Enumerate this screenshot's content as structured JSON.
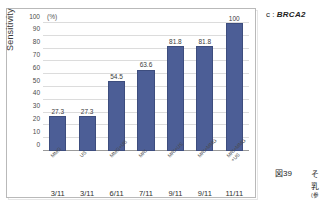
{
  "panel": {
    "tag_prefix": "c :",
    "tag_gene": "BRCA2"
  },
  "chart_data": {
    "type": "bar",
    "title": "",
    "xlabel": "",
    "ylabel": "Sensitivity",
    "yunit": "(%)",
    "ylim": [
      0,
      100
    ],
    "ytick_labels": [
      "100",
      "90",
      "80",
      "70",
      "60",
      "50",
      "40",
      "30",
      "20",
      "10",
      "0"
    ],
    "ytick_values": [
      100,
      90,
      80,
      70,
      60,
      50,
      40,
      30,
      20,
      10,
      0
    ],
    "grid": true,
    "legend": "none",
    "bar_color": "#4c5e96",
    "categories": [
      "MMG",
      "US",
      "MMG+US",
      "MRI",
      "MRI+US",
      "MRI+MMG",
      "MRI+MMG\n+US"
    ],
    "values": [
      27.3,
      27.3,
      54.5,
      63.6,
      81.8,
      81.8,
      100
    ],
    "data_labels": [
      "27.3",
      "27.3",
      "54.5",
      "63.6",
      "81.8",
      "81.8",
      "100"
    ],
    "fractions": [
      "3/11",
      "3/11",
      "6/11",
      "7/11",
      "9/11",
      "9/11",
      "11/11"
    ]
  },
  "caption": {
    "figure_number": "図39",
    "line1": "そ",
    "line2": "乳",
    "line3": "(参"
  }
}
